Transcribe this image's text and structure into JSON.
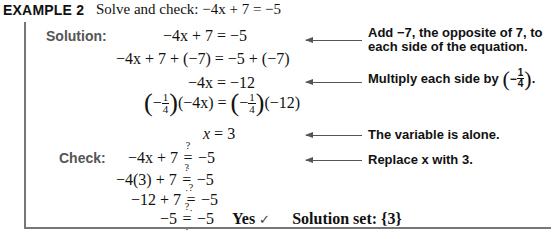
{
  "header": {
    "label": "EXAMPLE 2",
    "instruction": "Solve and check:",
    "equation": "−4x + 7 = −5"
  },
  "solution": {
    "label": "Solution:",
    "steps": [
      {
        "lhs": "−4x + 7",
        "rhs": "−5",
        "note_line1": "Add −7, the opposite of 7, to",
        "note_line2": "each side of the equation."
      },
      {
        "lhs": "−4x + 7 + (−7)",
        "rhs": "−5 + (−7)"
      },
      {
        "lhs": "−4x",
        "rhs": "−12",
        "note": "Multiply each side by",
        "note_frac_num": "1",
        "note_frac_den": "4"
      },
      {
        "lhs_factor_num": "1",
        "lhs_factor_den": "4",
        "lhs_rest": "(−4x)",
        "rhs_factor_num": "1",
        "rhs_factor_den": "4",
        "rhs_rest": "(−12)"
      },
      {
        "lhs": "x",
        "rhs": "3",
        "note": "The variable is alone."
      }
    ]
  },
  "check": {
    "label": "Check:",
    "question_mark": "?",
    "steps": [
      {
        "lhs": "−4x + 7",
        "rhs": "−5",
        "note": "Replace x with 3."
      },
      {
        "lhs": "−4(3) + 7",
        "rhs": "−5"
      },
      {
        "lhs": "−12 + 7",
        "rhs": "−5"
      },
      {
        "lhs": "−5",
        "rhs": "−5",
        "result": "Yes",
        "check_mark": "✓"
      }
    ],
    "solution_set_label": "Solution set:",
    "solution_set_value": "{3}"
  }
}
